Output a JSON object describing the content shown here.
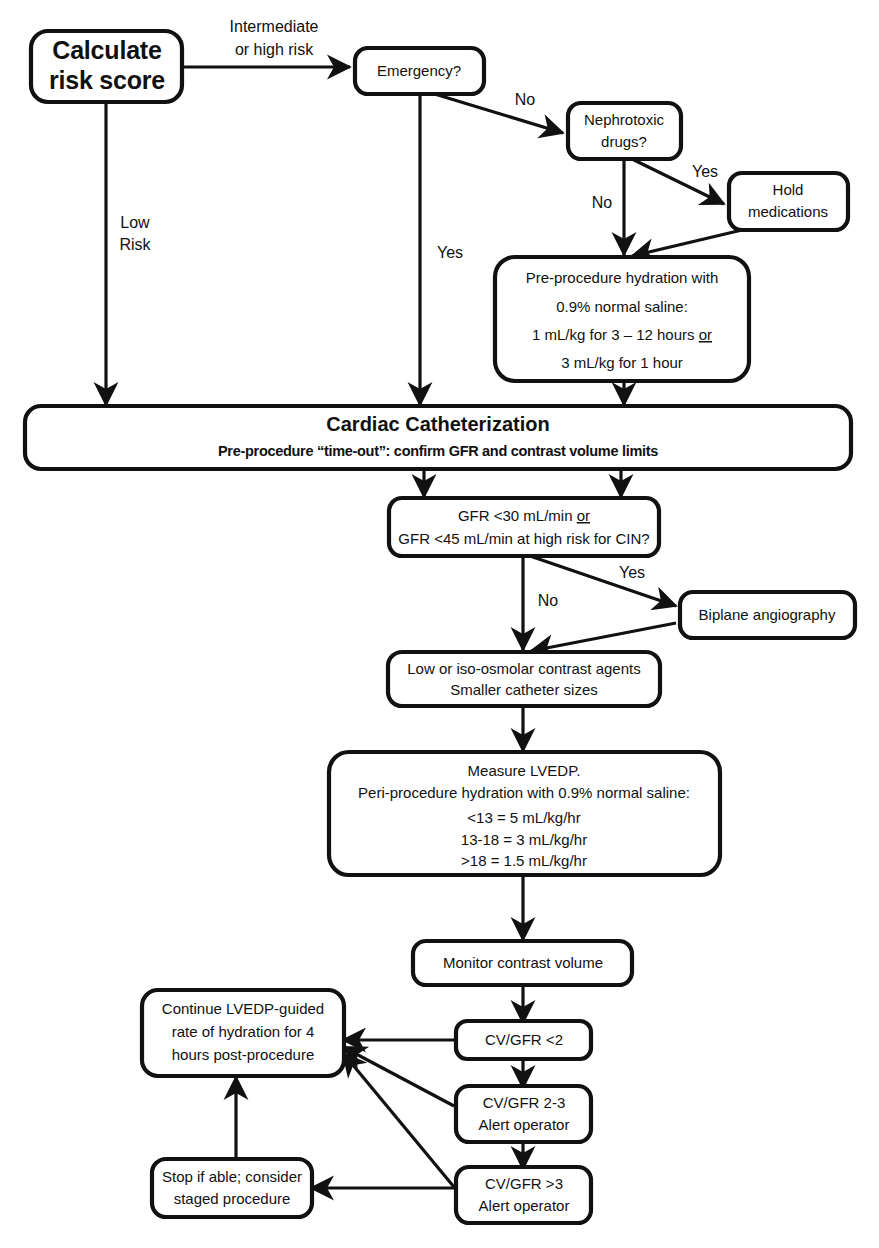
{
  "diagram": {
    "type": "flowchart",
    "background": "#ffffff",
    "line_color": "#111111"
  },
  "nodes": {
    "calculate_risk": {
      "lines": [
        "Calculate",
        "risk score"
      ]
    },
    "emergency": {
      "lines": [
        "Emergency?"
      ]
    },
    "nephrotoxic": {
      "lines": [
        "Nephrotoxic",
        "drugs?"
      ]
    },
    "hold_meds": {
      "lines": [
        "Hold",
        "medications"
      ]
    },
    "pre_hydration": {
      "lines": [
        "Pre-procedure hydration with",
        "0.9% normal saline:",
        "1 mL/kg for 3 – 12 hours or",
        "3 mL/kg for 1 hour"
      ],
      "underlined_word": "or"
    },
    "cardiac_cath": {
      "title": "Cardiac Catheterization",
      "subtitle": "Pre-procedure “time-out”: confirm GFR and contrast volume limits"
    },
    "gfr_decision": {
      "lines": [
        "GFR <30 mL/min or",
        "GFR <45 mL/min at high risk for CIN?"
      ],
      "underlined_word": "or"
    },
    "biplane": {
      "lines": [
        "Biplane angiography"
      ]
    },
    "contrast_agents": {
      "lines": [
        "Low or iso-osmolar contrast agents",
        "Smaller catheter sizes"
      ]
    },
    "measure_lvedp": {
      "lines": [
        "Measure LVEDP.",
        "Peri-procedure hydration with 0.9% normal saline:",
        "<13 = 5 mL/kg/hr",
        "13-18 = 3 mL/kg/hr",
        ">18 = 1.5 mL/kg/hr"
      ]
    },
    "monitor_contrast": {
      "lines": [
        "Monitor contrast volume"
      ]
    },
    "cv_gfr_lt2": {
      "lines": [
        "CV/GFR <2"
      ]
    },
    "cv_gfr_2_3": {
      "lines": [
        "CV/GFR 2-3",
        "Alert operator"
      ]
    },
    "cv_gfr_gt3": {
      "lines": [
        "CV/GFR >3",
        "Alert operator"
      ]
    },
    "continue_lvedp": {
      "lines": [
        "Continue LVEDP-guided",
        "rate of hydration for 4",
        "hours post-procedure"
      ]
    },
    "stop_if_able": {
      "lines": [
        "Stop if able; consider",
        "staged procedure"
      ]
    }
  },
  "edge_labels": {
    "intermediate_or_high_risk_l1": "Intermediate",
    "intermediate_or_high_risk_l2": "or high risk",
    "low_risk_l1": "Low",
    "low_risk_l2": "Risk",
    "emergency_yes": "Yes",
    "emergency_no": "No",
    "nephrotoxic_yes": "Yes",
    "nephrotoxic_no": "No",
    "gfr_yes": "Yes",
    "gfr_no": "No"
  }
}
